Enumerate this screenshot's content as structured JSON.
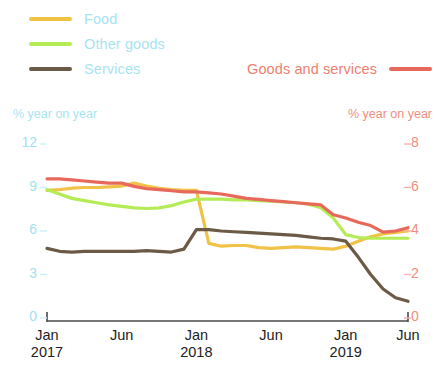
{
  "legend": {
    "items": [
      {
        "label": "Food",
        "color": "#f0c245",
        "text_color": "#a8e4ef"
      },
      {
        "label": "Other goods",
        "color": "#b5ec56",
        "text_color": "#a8e4ef"
      },
      {
        "label": "Services",
        "color": "#6b5a46",
        "text_color": "#a8e4ef"
      }
    ],
    "right_item": {
      "label": "Goods and services",
      "color": "#e8695c",
      "text_color": "#ef7f70"
    }
  },
  "axes": {
    "left_caption": "% year on year",
    "right_caption": "% year on year",
    "left_ticks": [
      "12",
      "9",
      "6",
      "3",
      "0"
    ],
    "right_ticks": [
      "8",
      "6",
      "4",
      "2",
      "0"
    ],
    "x_ticks": [
      {
        "month": "Jan",
        "year": "2017"
      },
      {
        "month": "Jun",
        "year": ""
      },
      {
        "month": "Jan",
        "year": "2018"
      },
      {
        "month": "Jun",
        "year": ""
      },
      {
        "month": "Jan",
        "year": "2019"
      },
      {
        "month": "Jun",
        "year": ""
      }
    ]
  },
  "chart_data": {
    "type": "line",
    "title": "",
    "xlabel": "",
    "ylabel": "% year on year",
    "y2label": "% year on year",
    "ylim": [
      0,
      12
    ],
    "y2lim": [
      0,
      8
    ],
    "grid": false,
    "legend_position": "top",
    "x_tick_labels": [
      "Jan 2017",
      "Jun",
      "Jan 2018",
      "Jun",
      "Jan 2019",
      "Jun"
    ],
    "x": [
      "2017-01",
      "2017-02",
      "2017-03",
      "2017-04",
      "2017-05",
      "2017-06",
      "2017-07",
      "2017-08",
      "2017-09",
      "2017-10",
      "2017-11",
      "2017-12",
      "2018-01",
      "2018-02",
      "2018-03",
      "2018-04",
      "2018-05",
      "2018-06",
      "2018-07",
      "2018-08",
      "2018-09",
      "2018-10",
      "2018-11",
      "2018-12",
      "2019-01",
      "2019-02",
      "2019-03",
      "2019-04",
      "2019-05",
      "2019-06"
    ],
    "series": [
      {
        "name": "Goods and services",
        "color": "#e8695c",
        "axis": "right",
        "values": [
          6.4,
          6.4,
          6.35,
          6.3,
          6.25,
          6.2,
          6.2,
          6.05,
          5.95,
          5.9,
          5.85,
          5.8,
          5.8,
          5.75,
          5.7,
          5.6,
          5.5,
          5.45,
          5.4,
          5.35,
          5.3,
          5.25,
          5.2,
          4.75,
          4.6,
          4.4,
          4.25,
          3.95,
          4.0,
          4.15
        ]
      },
      {
        "name": "Food",
        "color": "#f0c245",
        "axis": "left",
        "values": [
          8.8,
          8.85,
          8.95,
          9.0,
          9.0,
          9.05,
          9.1,
          9.3,
          9.1,
          8.95,
          8.85,
          8.8,
          8.8,
          5.15,
          4.95,
          5.0,
          5.0,
          4.85,
          4.8,
          4.85,
          4.9,
          4.85,
          4.8,
          4.75,
          4.95,
          5.3,
          5.6,
          5.8,
          5.9,
          6.0
        ]
      },
      {
        "name": "Other goods",
        "color": "#b5ec56",
        "axis": "left",
        "values": [
          8.85,
          8.55,
          8.25,
          8.1,
          7.95,
          7.8,
          7.7,
          7.6,
          7.55,
          7.6,
          7.75,
          8.0,
          8.2,
          8.2,
          8.2,
          8.15,
          8.15,
          8.1,
          8.05,
          8.0,
          7.95,
          7.85,
          7.6,
          6.9,
          5.75,
          5.55,
          5.5,
          5.5,
          5.5,
          5.5
        ]
      },
      {
        "name": "Services",
        "color": "#6b5a46",
        "axis": "left",
        "values": [
          4.8,
          4.6,
          4.55,
          4.6,
          4.6,
          4.6,
          4.6,
          4.6,
          4.65,
          4.6,
          4.55,
          4.75,
          6.1,
          6.1,
          6.0,
          5.95,
          5.9,
          5.85,
          5.8,
          5.75,
          5.7,
          5.6,
          5.5,
          5.45,
          5.3,
          4.2,
          3.0,
          2.0,
          1.4,
          1.15
        ]
      }
    ]
  }
}
